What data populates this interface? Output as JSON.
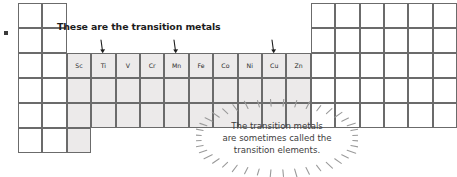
{
  "bullet": {
    "name": "bullet-marker"
  },
  "heading": {
    "text": "These are the transition metals"
  },
  "callout": {
    "line1": "The transition metals",
    "line2": "are sometimes called the",
    "line3": "transition elements."
  },
  "colors": {
    "grid_border": "#6b6b6b",
    "shaded_cell": "#eceaea",
    "white_cell": "#ffffff",
    "text": "#2b2b2b",
    "heading_text": "#1d1d1d",
    "callout_text": "#3c3c3c",
    "burst_ray": "#9a9a9a",
    "arrow": "#1d1d1d"
  },
  "grid": {
    "cell_width": 24.4,
    "cell_height": 25.0,
    "origin_x": 18,
    "origin_y": 3,
    "left_block_columns": 2,
    "left_block_rows": 6,
    "transition_block_rows": 3,
    "right_block_columns": 6,
    "right_block_rows": 5
  },
  "elements": {
    "symbols": [
      "Sc",
      "Ti",
      "V",
      "Cr",
      "Mn",
      "Fe",
      "Co",
      "Ni",
      "Cu",
      "Zn"
    ]
  },
  "arrows": [
    {
      "name": "arrow-to-ti",
      "points_to": "Ti"
    },
    {
      "name": "arrow-to-mn",
      "points_to": "Mn"
    },
    {
      "name": "arrow-to-cu",
      "points_to": "Cu"
    }
  ]
}
